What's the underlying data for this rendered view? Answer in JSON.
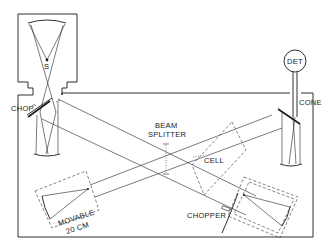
{
  "diagram": {
    "labels": {
      "source": "S",
      "chop": "CHOP",
      "detector": "DET",
      "cone": "CONE",
      "beam_splitter_line1": "BEAM",
      "beam_splitter_line2": "SPLITTER",
      "cell": "CELL",
      "chopper": "CHOPPER",
      "movable_line1": "MOVABLE",
      "movable_line2": "20 CM"
    },
    "components": [
      {
        "id": "source-housing",
        "label": "S"
      },
      {
        "id": "source-chopper",
        "label": "CHOP"
      },
      {
        "id": "detector",
        "label": "DET"
      },
      {
        "id": "light-cone",
        "label": "CONE"
      },
      {
        "id": "beam-splitter",
        "label": "BEAM SPLITTER"
      },
      {
        "id": "gas-cell",
        "label": "CELL"
      },
      {
        "id": "beam-chopper",
        "label": "CHOPPER"
      },
      {
        "id": "movable-mirror-assembly",
        "label": "MOVABLE 20 CM"
      },
      {
        "id": "fixed-mirror-assembly",
        "label": ""
      }
    ],
    "colors": {
      "ink": "#1a1a1a",
      "background": "#ffffff"
    }
  }
}
